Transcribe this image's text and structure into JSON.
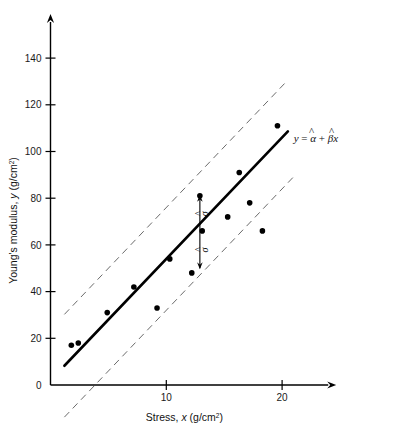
{
  "chart_data": {
    "type": "scatter",
    "title": "",
    "xlabel": "Stress, x (g/cm2)",
    "xlabel_main": "Stress,",
    "xlabel_var": "x",
    "xlabel_units_base": "(g/cm",
    "xlabel_units_sup": "2",
    "xlabel_units_close": ")",
    "ylabel": "Young's modulus, y (g/cm2)",
    "ylabel_main": "Young's modulus,",
    "ylabel_var": "y",
    "ylabel_units_base": "(g/cm",
    "ylabel_units_sup": "2",
    "ylabel_units_close": ")",
    "xlim": [
      0,
      24.5
    ],
    "ylim": [
      0,
      158
    ],
    "xticks": [
      10,
      20
    ],
    "xtick_labels": [
      "10",
      "20"
    ],
    "yticks": [
      0,
      20,
      40,
      60,
      80,
      100,
      120,
      140
    ],
    "ytick_labels": [
      "0",
      "20",
      "40",
      "60",
      "80",
      "100",
      "120",
      "140"
    ],
    "origin_label": "0",
    "grid": false,
    "legend": "none",
    "points": [
      {
        "x": 1.8,
        "y": 17
      },
      {
        "x": 2.4,
        "y": 18
      },
      {
        "x": 4.9,
        "y": 31
      },
      {
        "x": 7.2,
        "y": 42
      },
      {
        "x": 9.2,
        "y": 33
      },
      {
        "x": 10.3,
        "y": 54
      },
      {
        "x": 12.2,
        "y": 48
      },
      {
        "x": 12.9,
        "y": 81
      },
      {
        "x": 13.1,
        "y": 66
      },
      {
        "x": 15.3,
        "y": 72
      },
      {
        "x": 16.3,
        "y": 91
      },
      {
        "x": 17.2,
        "y": 78
      },
      {
        "x": 18.3,
        "y": 66
      },
      {
        "x": 19.6,
        "y": 111
      }
    ],
    "fit_line": {
      "label": "y = a + bx",
      "intercept": 2.0,
      "slope": 5.2,
      "x_start": 1.2,
      "x_end": 20.5,
      "style": "solid",
      "color": "#000000",
      "width": 2.6
    },
    "band_upper": {
      "offset": 22,
      "x_start": 1.2,
      "x_end": 20.5,
      "style": "dashed",
      "color": "#6b6b6b"
    },
    "band_lower": {
      "offset": -22,
      "x_start": 1.2,
      "x_end": 21.2,
      "style": "dashed",
      "color": "#6b6b6b"
    },
    "sigma_arrow": {
      "x": 12.9,
      "y_top": 81,
      "y_bottom": 50,
      "upper_label": "σ",
      "lower_label": "σ",
      "hat": "^"
    },
    "annotations": [
      {
        "name": "regression-equation",
        "x": 21.0,
        "y": 104,
        "text": "y = α̂ + β̂x",
        "parts": {
          "y": "y",
          "eq": "=",
          "alpha": "α",
          "plus": "+",
          "beta": "β",
          "x": "x",
          "hat": "^"
        }
      }
    ],
    "colors": {
      "point": "#000000",
      "line": "#000000",
      "band": "#6b6b6b",
      "axis": "#000000",
      "text": "#111111",
      "background": "#ffffff"
    }
  }
}
